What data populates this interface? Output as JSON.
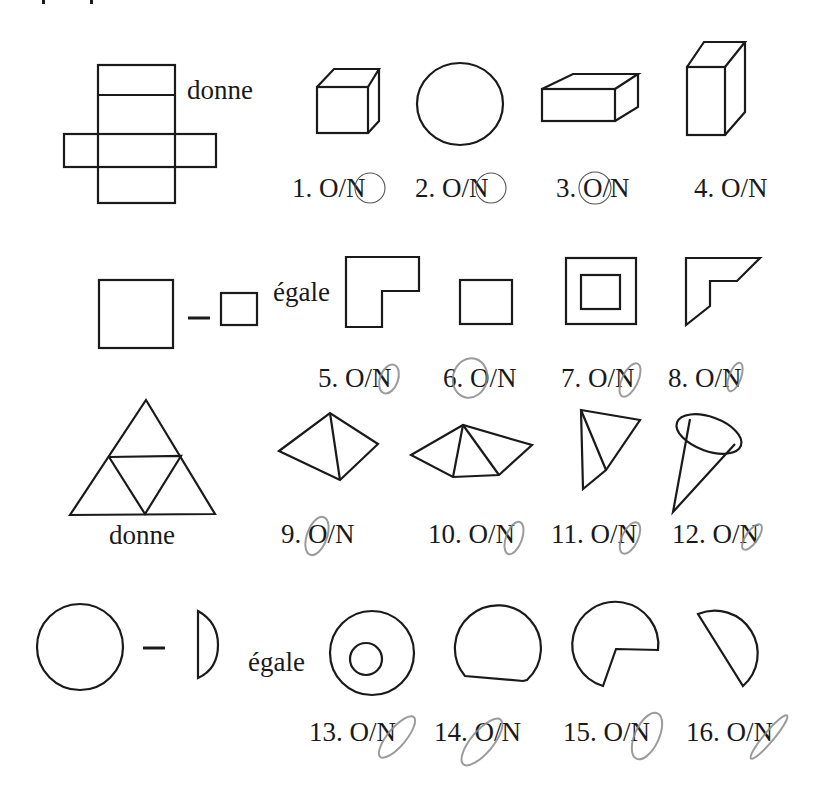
{
  "page": {
    "background": "#ffffff",
    "ink_color": "#1a1a1a",
    "pencil_color": "#8a8a8a"
  },
  "words": {
    "gives": "donne",
    "equals": "égale",
    "minus": "–"
  },
  "answer_format": "O/N",
  "problems": [
    {
      "id": "net-cross",
      "given_word": "donne",
      "given_description": "cross-shaped unfolded net of six rectangles",
      "items": [
        {
          "number": "1.",
          "label": "O/N",
          "shape": "cube",
          "circled": "N",
          "mark": "pen"
        },
        {
          "number": "2.",
          "label": "O/N",
          "shape": "circle",
          "circled": "N",
          "mark": "pen"
        },
        {
          "number": "3.",
          "label": "O/N",
          "shape": "flat-box",
          "circled": "O",
          "mark": "pen"
        },
        {
          "number": "4.",
          "label": "O/N",
          "shape": "tall-box",
          "circled": "",
          "mark": ""
        }
      ]
    },
    {
      "id": "square-minus-square",
      "given_word": "égale",
      "given_description": "large square minus small square",
      "items": [
        {
          "number": "5.",
          "label": "O/N",
          "shape": "L-shape",
          "circled": "N",
          "mark": "pencil"
        },
        {
          "number": "6.",
          "label": "O/N",
          "shape": "rectangle",
          "circled": "O",
          "mark": "pencil"
        },
        {
          "number": "7.",
          "label": "O/N",
          "shape": "square-frame",
          "circled": "N",
          "mark": "pencil"
        },
        {
          "number": "8.",
          "label": "O/N",
          "shape": "bevelled-L",
          "circled": "N",
          "mark": "pencil"
        }
      ]
    },
    {
      "id": "triangle-net",
      "given_word": "donne",
      "given_description": "equilateral triangle divided into four triangles",
      "items": [
        {
          "number": "9.",
          "label": "O/N",
          "shape": "tetrahedron",
          "circled": "O",
          "mark": "pencil"
        },
        {
          "number": "10.",
          "label": "O/N",
          "shape": "open-pyramid",
          "circled": "N",
          "mark": "pencil"
        },
        {
          "number": "11.",
          "label": "O/N",
          "shape": "thin-tetrahedron",
          "circled": "N",
          "mark": "pencil"
        },
        {
          "number": "12.",
          "label": "O/N",
          "shape": "cone",
          "circled": "N",
          "mark": "pencil"
        }
      ]
    },
    {
      "id": "circle-minus-segment",
      "given_word": "égale",
      "given_description": "circle minus circular segment",
      "items": [
        {
          "number": "13.",
          "label": "O/N",
          "shape": "annulus",
          "circled": "N",
          "mark": "pencil"
        },
        {
          "number": "14.",
          "label": "O/N",
          "shape": "truncated-circle",
          "circled": "O",
          "mark": "pencil"
        },
        {
          "number": "15.",
          "label": "O/N",
          "shape": "pac-man-sector",
          "circled": "N",
          "mark": "pencil"
        },
        {
          "number": "16.",
          "label": "O/N",
          "shape": "half-disc",
          "circled": "N",
          "mark": "pencil"
        }
      ]
    }
  ]
}
